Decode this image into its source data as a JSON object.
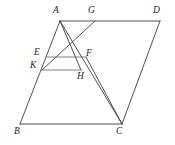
{
  "figure": {
    "canvas": {
      "width": 175,
      "height": 145,
      "background": "#ffffff"
    },
    "stroke_color": "#3d3d3d",
    "label_color": "#232323",
    "points": [
      {
        "id": "A",
        "label": "A",
        "x": 60,
        "y": 21,
        "label_x": 56,
        "label_y": 5
      },
      {
        "id": "G",
        "label": "G",
        "x": 95,
        "y": 21,
        "label_x": 91,
        "label_y": 5
      },
      {
        "id": "D",
        "label": "D",
        "x": 160,
        "y": 21,
        "label_x": 156,
        "label_y": 5
      },
      {
        "id": "E",
        "label": "E",
        "x": 47,
        "y": 57,
        "label_x": 35,
        "label_y": 48
      },
      {
        "id": "F",
        "label": "F",
        "x": 86,
        "y": 57,
        "label_x": 86,
        "label_y": 48
      },
      {
        "id": "K",
        "label": "K",
        "x": 42,
        "y": 70,
        "label_x": 31,
        "label_y": 61
      },
      {
        "id": "H",
        "label": "H",
        "x": 81,
        "y": 70,
        "label_x": 78,
        "label_y": 72
      },
      {
        "id": "B",
        "label": "B",
        "x": 20,
        "y": 124,
        "label_x": 16,
        "label_y": 127
      },
      {
        "id": "C",
        "label": "C",
        "x": 122,
        "y": 124,
        "label_x": 118,
        "label_y": 127
      }
    ],
    "segments": [
      {
        "name": "side-AD",
        "from": "A",
        "to": "D",
        "weight": "normal"
      },
      {
        "name": "side-AB",
        "from": "A",
        "to": "B",
        "weight": "normal"
      },
      {
        "name": "side-BC",
        "from": "B",
        "to": "C",
        "weight": "normal"
      },
      {
        "name": "side-DC",
        "from": "D",
        "to": "C",
        "weight": "normal"
      },
      {
        "name": "segment-EF",
        "from": "E",
        "to": "F",
        "weight": "thin"
      },
      {
        "name": "segment-KH",
        "from": "K",
        "to": "H",
        "weight": "thin"
      },
      {
        "name": "segment-AH",
        "from": "A",
        "to": "H",
        "weight": "normal"
      },
      {
        "name": "segment-AC",
        "from": "A",
        "to": "C",
        "weight": "normal"
      },
      {
        "name": "segment-GK",
        "from": "G",
        "to": "K",
        "weight": "normal"
      },
      {
        "name": "segment-FC",
        "from": "F",
        "to": "C",
        "weight": "normal"
      }
    ]
  }
}
